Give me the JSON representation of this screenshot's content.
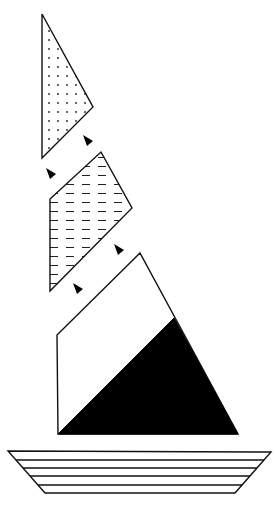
{
  "diagram": {
    "title": "Sailboat assembled from geometric pieces",
    "colors": {
      "stroke": "#111111",
      "background": "#ffffff",
      "fill_black": "#000000"
    },
    "pieces": [
      {
        "id": "top-triangle",
        "label": "Dotted triangle",
        "pattern": "dots",
        "points": "42,14 93,107 42,158"
      },
      {
        "id": "middle-quadrilateral",
        "label": "Dashed quadrilateral",
        "pattern": "dashes",
        "points": "101,152 132,208 50,291 50,199"
      },
      {
        "id": "sail",
        "label": "Main sail",
        "pattern": "none",
        "points": "140,253 238,434 58,434 57,335"
      },
      {
        "id": "sail-black-triangle",
        "label": "Black lower sail triangle",
        "pattern": "solid-black",
        "points": "174,318 238,434 58,434"
      },
      {
        "id": "hull",
        "label": "Striped hull",
        "pattern": "horizontal-stripes",
        "points": "8,451 271,452 235,493 45,493",
        "stripe_ys": [
          460,
          468,
          476,
          485
        ]
      }
    ],
    "arrows": [
      {
        "id": "arrow-1",
        "x": 88,
        "y": 141,
        "direction": "up-left"
      },
      {
        "id": "arrow-2",
        "x": 51,
        "y": 174,
        "direction": "up-left"
      },
      {
        "id": "arrow-3",
        "x": 119,
        "y": 250,
        "direction": "up-left"
      },
      {
        "id": "arrow-4",
        "x": 78,
        "y": 289,
        "direction": "up-left"
      }
    ]
  }
}
